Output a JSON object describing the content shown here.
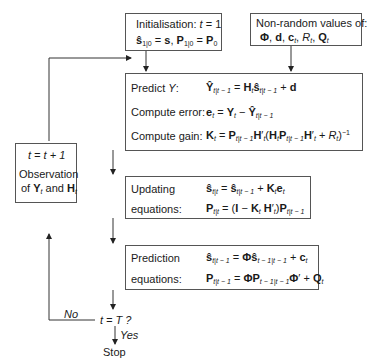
{
  "init_box": {
    "title": "Initialisation: t = 1",
    "eq": "ŝ1|0 = s, P1|0 = P0"
  },
  "nonrandom_box": {
    "title": "Non-random values of:",
    "eq": "Φ, d, ct, Rt, Qt"
  },
  "predict_box": {
    "rows": [
      {
        "label": "Predict Y:",
        "eq": "Ŷt|t−1 = Ht ŝt|t−1 + d"
      },
      {
        "label": "Compute error:",
        "eq": "et = Yt − Ŷt|t−1"
      },
      {
        "label": "Compute gain:",
        "eq": "Kt = Pt|t−1 H't (Ht Pt|t−1 H't + Rt)^−1"
      }
    ]
  },
  "updating_box": {
    "rows": [
      {
        "label": "Updating",
        "eq": "ŝt|t = ŝt|t−1 + Kt et"
      },
      {
        "label": "equations:",
        "eq": "Pt|t = (I − Kt H't) Pt|t−1"
      }
    ]
  },
  "prediction_box": {
    "rows": [
      {
        "label": "Prediction",
        "eq": "ŝt|t−1 = Φ ŝt−1|t−1 + ct"
      },
      {
        "label": "equations:",
        "eq": "Pt|t−1 = Φ Pt−1|t−1 Φ' + Qt"
      }
    ]
  },
  "observation_box": {
    "increment": "t = t + 1",
    "line1": "Observation",
    "line2": "of Yt and Ht"
  },
  "decision": {
    "label": "t = T ?",
    "no": "No",
    "yes": "Yes",
    "stop": "Stop"
  }
}
